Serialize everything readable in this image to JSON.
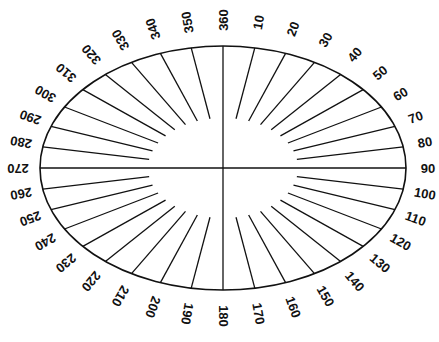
{
  "diagram": {
    "type": "elliptical-protractor",
    "center": [
      223,
      168
    ],
    "outer_radii": [
      183,
      122
    ],
    "inner_radii": [
      75,
      50
    ],
    "label_radii": [
      205,
      148
    ],
    "line_color": "#111111",
    "step_degrees": 10,
    "labels": [
      "360",
      "10",
      "20",
      "30",
      "40",
      "50",
      "60",
      "70",
      "80",
      "90",
      "100",
      "110",
      "120",
      "130",
      "140",
      "150",
      "160",
      "170",
      "180",
      "190",
      "200",
      "210",
      "220",
      "230",
      "240",
      "250",
      "260",
      "270",
      "280",
      "290",
      "300",
      "310",
      "320",
      "330",
      "340",
      "350"
    ]
  }
}
